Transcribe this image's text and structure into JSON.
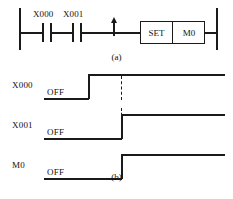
{
  "figure": {
    "ladder": {
      "caption": "(a)",
      "contacts": [
        {
          "name": "X000",
          "type": "normally-open"
        },
        {
          "name": "X001",
          "type": "normally-open"
        }
      ],
      "edge_symbol": "rising-edge-arrow",
      "instruction": {
        "opcode": "SET",
        "operand": "M0"
      }
    },
    "timing": {
      "caption": "(b)",
      "off_label": "OFF",
      "signals": [
        {
          "name": "X000",
          "state_label": "OFF",
          "rise_x": 89
        },
        {
          "name": "X001",
          "state_label": "OFF",
          "rise_x": 122
        },
        {
          "name": "M0",
          "state_label": "OFF",
          "rise_x": 122
        }
      ],
      "reference_line": "dashed-vertical-marker"
    }
  },
  "colors": {
    "ink": "#1a1a1a",
    "background": "#ffffff"
  }
}
